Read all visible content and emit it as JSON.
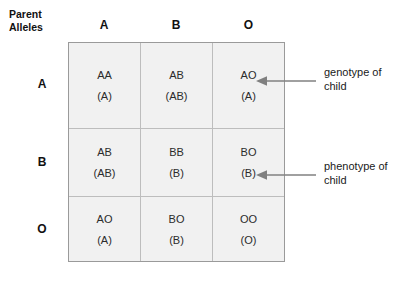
{
  "diagram": {
    "corner_label": {
      "line1": "Parent",
      "line2": "Alleles"
    },
    "column_headers": [
      "A",
      "B",
      "O"
    ],
    "row_headers": [
      "A",
      "B",
      "O"
    ],
    "grid": [
      [
        {
          "genotype": "AA",
          "phenotype": "(A)"
        },
        {
          "genotype": "AB",
          "phenotype": "(AB)"
        },
        {
          "genotype": "AO",
          "phenotype": "(A)"
        }
      ],
      [
        {
          "genotype": "AB",
          "phenotype": "(AB)"
        },
        {
          "genotype": "BB",
          "phenotype": "(B)"
        },
        {
          "genotype": "BO",
          "phenotype": "(B)"
        }
      ],
      [
        {
          "genotype": "AO",
          "phenotype": "(A)"
        },
        {
          "genotype": "BO",
          "phenotype": "(B)"
        },
        {
          "genotype": "OO",
          "phenotype": "(O)"
        }
      ]
    ],
    "annotations": [
      {
        "line1": "genotype of",
        "line2": "child"
      },
      {
        "line1": "phenotype of",
        "line2": "child"
      }
    ],
    "colors": {
      "cell_fill": "#f1f1f1",
      "grid_outer_border": "#9a9a9a",
      "grid_inner_border": "#bdbdbd",
      "arrow": "#808080",
      "text": "#1a1a1a"
    }
  }
}
